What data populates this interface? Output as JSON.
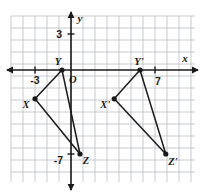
{
  "chart_data": {
    "type": "scatter",
    "title": "",
    "xlabel": "x",
    "ylabel": "y",
    "grid": true,
    "legend": null,
    "xlim": [
      -4,
      8
    ],
    "ylim": [
      -9,
      4
    ],
    "x_tick_labels": [
      "-3",
      "7"
    ],
    "y_tick_labels": [
      "3",
      "-7"
    ],
    "x_ticks": [
      -3,
      7
    ],
    "y_ticks": [
      3,
      -7
    ],
    "origin_label": "O",
    "axis_labels": {
      "x": "x",
      "y": "y"
    },
    "series": [
      {
        "name": "Triangle XYZ",
        "closed": true,
        "points": [
          {
            "label": "X",
            "x": -3,
            "y": -2.4
          },
          {
            "label": "Y",
            "x": -0.75,
            "y": 0
          },
          {
            "label": "Z",
            "x": 0.75,
            "y": -7
          }
        ]
      },
      {
        "name": "Triangle X'Y'Z'",
        "closed": true,
        "points": [
          {
            "label": "X'",
            "x": 3.6,
            "y": -2.4
          },
          {
            "label": "Y'",
            "x": 5.75,
            "y": 0
          },
          {
            "label": "Z'",
            "x": 7.9,
            "y": -7
          }
        ]
      }
    ]
  },
  "style": {
    "grid_color": "#b9bcc0",
    "axis_color": "#1a1a1a",
    "point_color": "#1a1a1a",
    "line_color": "#1a1a1a",
    "background": "#ffffff"
  },
  "geometry": {
    "origin_px": {
      "x": 71,
      "y": 70
    },
    "unit_px": 12,
    "grid_rect": {
      "x": 11,
      "y": 16,
      "w": 184,
      "h": 166
    }
  }
}
